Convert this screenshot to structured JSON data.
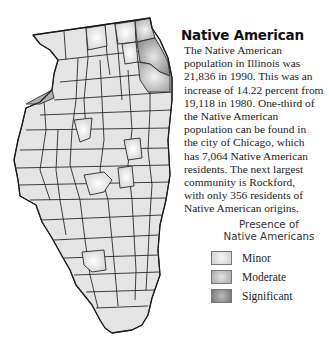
{
  "title": "Native American",
  "body_lines": [
    "The Native American",
    "population in Illinois was",
    "21,836 in 1990. This was an",
    "increase of 14.22 percent from",
    "19,118 in 1980. One-third of",
    "the Native American",
    "population can be found in",
    "the city of Chicago, which",
    "has 7,064 Native American",
    "residents. The next largest",
    "community is Rockford,",
    "with only 356 residents of",
    "Native American origins."
  ],
  "legend": {
    "title_lines": [
      "Presence of",
      "Native Americans"
    ],
    "items": [
      {
        "label": "Minor",
        "color": "#dcdcdc"
      },
      {
        "label": "Moderate",
        "color": "#b8b8b8"
      },
      {
        "label": "Significant",
        "color": "#8c8c8c"
      }
    ]
  },
  "map": {
    "region": "Illinois",
    "base_color": "#e4e4e4",
    "minor_color": "#dcdcdc",
    "moderate_color": "#b8b8b8",
    "significant_color": "#8c8c8c"
  }
}
